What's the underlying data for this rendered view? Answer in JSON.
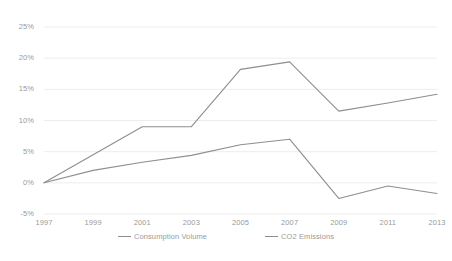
{
  "chart_data": {
    "type": "line",
    "title": "",
    "xlabel": "",
    "ylabel": "",
    "grid": true,
    "legend_position": "bottom",
    "x": [
      1997,
      1999,
      2001,
      2003,
      2005,
      2007,
      2009,
      2011,
      2013
    ],
    "categories": [
      "1997",
      "1999",
      "2001",
      "2003",
      "2005",
      "2007",
      "2009",
      "2011",
      "2013"
    ],
    "ylim": [
      -5,
      25
    ],
    "yticks": [
      -5,
      0,
      5,
      10,
      15,
      20,
      25
    ],
    "ytick_labels": [
      "-5%",
      "0%",
      "5%",
      "10%",
      "15%",
      "20%",
      "25%"
    ],
    "series": [
      {
        "name": "Consumption Volume",
        "color": "#8e8e8e",
        "values": [
          0.0,
          2.0,
          3.3,
          4.4,
          6.1,
          7.0,
          -2.5,
          -0.5,
          -1.7
        ]
      },
      {
        "name": "CO2 Emissions",
        "color": "#8e8e8e",
        "values": [
          0.0,
          4.5,
          9.0,
          9.0,
          18.2,
          19.4,
          11.5,
          12.8,
          14.2
        ]
      }
    ]
  },
  "legend": {
    "items": [
      {
        "label": "Consumption Volume"
      },
      {
        "label": "CO2 Emissions"
      }
    ]
  },
  "colors": {
    "grid": "#e8e8e8",
    "line": "#8e8e8e",
    "text": "#9a9a9a",
    "background": "#ffffff"
  }
}
